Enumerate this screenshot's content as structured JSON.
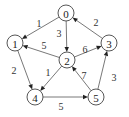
{
  "diagram": {
    "type": "directed-weighted-graph",
    "nodes": [
      {
        "id": "0",
        "label": "0"
      },
      {
        "id": "1",
        "label": "1"
      },
      {
        "id": "2",
        "label": "2"
      },
      {
        "id": "3",
        "label": "3"
      },
      {
        "id": "4",
        "label": "4"
      },
      {
        "id": "5",
        "label": "5"
      }
    ],
    "edges": [
      {
        "from": "0",
        "to": "1",
        "weight": "1"
      },
      {
        "from": "0",
        "to": "2",
        "weight": "3"
      },
      {
        "from": "3",
        "to": "0",
        "weight": "2"
      },
      {
        "from": "2",
        "to": "1",
        "weight": "5"
      },
      {
        "from": "2",
        "to": "3",
        "weight": "6"
      },
      {
        "from": "1",
        "to": "4",
        "weight": "2"
      },
      {
        "from": "2",
        "to": "4",
        "weight": "1"
      },
      {
        "from": "5",
        "to": "2",
        "weight": "7"
      },
      {
        "from": "4",
        "to": "5",
        "weight": "5"
      },
      {
        "from": "5",
        "to": "3",
        "weight": "3"
      }
    ],
    "colors": {
      "node_stroke": "#444444",
      "edge": "#555555",
      "text": "#222222"
    }
  }
}
